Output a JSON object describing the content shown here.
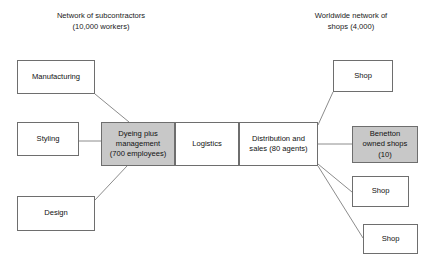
{
  "diagram": {
    "colors": {
      "shaded_fill": "#c8c8c8",
      "plain_fill": "#ffffff",
      "border": "#6e6e6e",
      "connector": "#8c8c8c",
      "text": "#111111",
      "background": "#ffffff"
    },
    "captions": {
      "left": "Network of subcontractors\n(10,000 workers)",
      "right": "Worldwide network of\nshops (4,000)"
    },
    "nodes": {
      "manufacturing": "Manufacturing",
      "styling": "Styling",
      "design": "Design",
      "dyeing": "Dyeing plus\nmanagement\n(700 employees)",
      "logistics": "Logistics",
      "distribution": "Distribution and\nsales (80 agents)",
      "shop_1": "Shop",
      "benetton_owned": "Benetton\nowned shops\n(10)",
      "shop_2": "Shop",
      "shop_3": "Shop"
    }
  }
}
